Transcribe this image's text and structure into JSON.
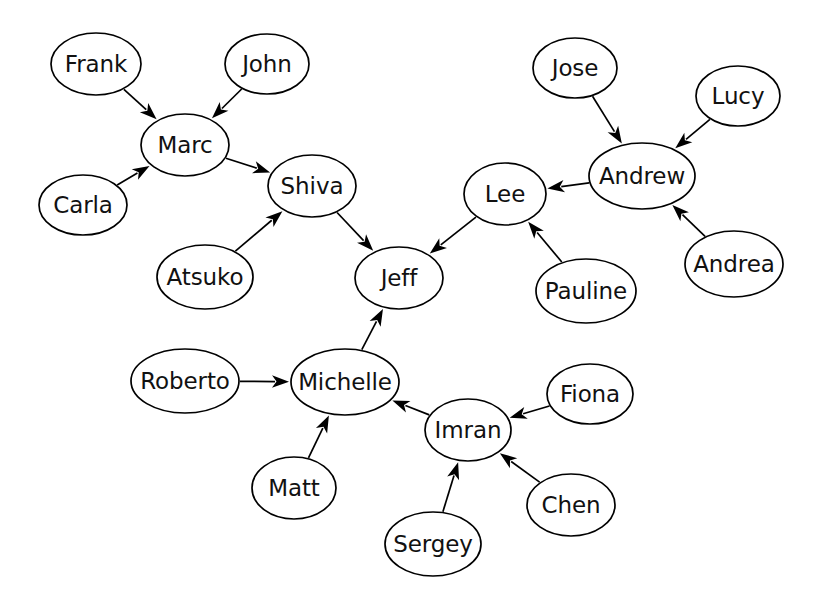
{
  "diagram": {
    "type": "directed-graph",
    "background_color": "#ffffff",
    "node_fill_color": "#ffffff",
    "node_stroke_color": "#000000",
    "edge_color": "#000000",
    "label_color": "#111111",
    "node_count": 20,
    "edge_count": 19,
    "canvas": {
      "width": 818,
      "height": 605
    }
  },
  "nodes": [
    {
      "id": "frank",
      "label": "Frank",
      "cx": 96,
      "cy": 64,
      "rx": 45,
      "ry": 31
    },
    {
      "id": "john",
      "label": "John",
      "cx": 267,
      "cy": 64,
      "rx": 42,
      "ry": 30
    },
    {
      "id": "marc",
      "label": "Marc",
      "cx": 185,
      "cy": 145,
      "rx": 44,
      "ry": 31
    },
    {
      "id": "carla",
      "label": "Carla",
      "cx": 83,
      "cy": 205,
      "rx": 44,
      "ry": 30
    },
    {
      "id": "shiva",
      "label": "Shiva",
      "cx": 312,
      "cy": 186,
      "rx": 44,
      "ry": 31
    },
    {
      "id": "atsuko",
      "label": "Atsuko",
      "cx": 205,
      "cy": 277,
      "rx": 48,
      "ry": 32
    },
    {
      "id": "jeff",
      "label": "Jeff",
      "cx": 399,
      "cy": 278,
      "rx": 44,
      "ry": 31
    },
    {
      "id": "jose",
      "label": "Jose",
      "cx": 575,
      "cy": 68,
      "rx": 42,
      "ry": 30
    },
    {
      "id": "lucy",
      "label": "Lucy",
      "cx": 738,
      "cy": 96,
      "rx": 42,
      "ry": 30
    },
    {
      "id": "andrew",
      "label": "Andrew",
      "cx": 642,
      "cy": 176,
      "rx": 53,
      "ry": 33
    },
    {
      "id": "andrea",
      "label": "Andrea",
      "cx": 734,
      "cy": 264,
      "rx": 49,
      "ry": 33
    },
    {
      "id": "lee",
      "label": "Lee",
      "cx": 505,
      "cy": 194,
      "rx": 41,
      "ry": 31
    },
    {
      "id": "pauline",
      "label": "Pauline",
      "cx": 586,
      "cy": 291,
      "rx": 50,
      "ry": 32
    },
    {
      "id": "michelle",
      "label": "Michelle",
      "cx": 345,
      "cy": 382,
      "rx": 54,
      "ry": 33
    },
    {
      "id": "roberto",
      "label": "Roberto",
      "cx": 185,
      "cy": 381,
      "rx": 54,
      "ry": 32
    },
    {
      "id": "matt",
      "label": "Matt",
      "cx": 294,
      "cy": 488,
      "rx": 42,
      "ry": 31
    },
    {
      "id": "imran",
      "label": "Imran",
      "cx": 468,
      "cy": 430,
      "rx": 43,
      "ry": 31
    },
    {
      "id": "fiona",
      "label": "Fiona",
      "cx": 590,
      "cy": 394,
      "rx": 43,
      "ry": 30
    },
    {
      "id": "chen",
      "label": "Chen",
      "cx": 571,
      "cy": 505,
      "rx": 44,
      "ry": 31
    },
    {
      "id": "sergey",
      "label": "Sergey",
      "cx": 433,
      "cy": 544,
      "rx": 48,
      "ry": 32
    }
  ],
  "edges": [
    {
      "from": "frank",
      "to": "marc",
      "label": ""
    },
    {
      "from": "john",
      "to": "marc",
      "label": ""
    },
    {
      "from": "carla",
      "to": "marc",
      "label": ""
    },
    {
      "from": "marc",
      "to": "shiva",
      "label": ""
    },
    {
      "from": "atsuko",
      "to": "shiva",
      "label": ""
    },
    {
      "from": "shiva",
      "to": "jeff",
      "label": ""
    },
    {
      "from": "lee",
      "to": "jeff",
      "label": ""
    },
    {
      "from": "michelle",
      "to": "jeff",
      "label": ""
    },
    {
      "from": "jose",
      "to": "andrew",
      "label": ""
    },
    {
      "from": "lucy",
      "to": "andrew",
      "label": ""
    },
    {
      "from": "andrea",
      "to": "andrew",
      "label": ""
    },
    {
      "from": "andrew",
      "to": "lee",
      "label": ""
    },
    {
      "from": "pauline",
      "to": "lee",
      "label": ""
    },
    {
      "from": "roberto",
      "to": "michelle",
      "label": ""
    },
    {
      "from": "matt",
      "to": "michelle",
      "label": ""
    },
    {
      "from": "imran",
      "to": "michelle",
      "label": ""
    },
    {
      "from": "fiona",
      "to": "imran",
      "label": ""
    },
    {
      "from": "chen",
      "to": "imran",
      "label": ""
    },
    {
      "from": "sergey",
      "to": "imran",
      "label": ""
    }
  ]
}
